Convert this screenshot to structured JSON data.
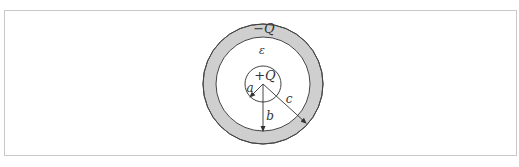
{
  "figure": {
    "labels": {
      "outer_charge": "−Q",
      "dielectric": "ε",
      "inner_charge": "+Q",
      "radius_a": "a",
      "radius_b": "b",
      "radius_c": "c"
    },
    "geometry": {
      "center": [
        263,
        84
      ],
      "radius_a": 18,
      "radius_b": 47,
      "radius_c": 60
    },
    "colors": {
      "shell_fill": "#cfcfcf",
      "stroke": "#444444",
      "frame_border": "#c8c8c8",
      "background": "#ffffff"
    }
  }
}
